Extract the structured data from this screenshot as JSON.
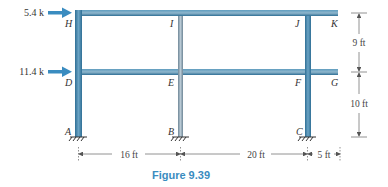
{
  "figure": {
    "caption": "Figure 9.39",
    "colors": {
      "member": "#3b7fa6",
      "member_light": "#8fb3c8",
      "interior_column": "#9ab0bf",
      "load_arrow": "#3a8cc0",
      "caption": "#3a8cc0",
      "dimension": "#666666"
    },
    "loads": [
      {
        "label": "5.4 k",
        "at_joint": "H",
        "direction": "right"
      },
      {
        "label": "11.4 k",
        "at_joint": "D",
        "direction": "right"
      }
    ],
    "joints": {
      "A": "A",
      "B": "B",
      "C": "C",
      "D": "D",
      "E": "E",
      "F": "F",
      "G": "G",
      "H": "H",
      "I": "I",
      "J": "J",
      "K": "K"
    },
    "supports": [
      {
        "joint": "A",
        "type": "fixed"
      },
      {
        "joint": "B",
        "type": "fixed"
      },
      {
        "joint": "C",
        "type": "fixed"
      }
    ],
    "dimensions": {
      "horizontal": [
        "16 ft",
        "20 ft",
        "5 ft"
      ],
      "vertical": [
        "9 ft",
        "10 ft"
      ]
    }
  }
}
